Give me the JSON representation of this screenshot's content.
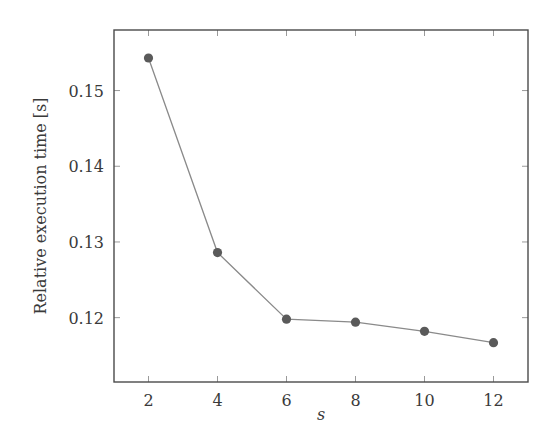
{
  "chart_data": {
    "type": "line",
    "title": "",
    "xlabel": "s",
    "ylabel": "Relative execution time [s]",
    "x": [
      2,
      4,
      6,
      8,
      10,
      12
    ],
    "series": [
      {
        "name": "Relative execution time",
        "values": [
          0.1543,
          0.1286,
          0.1198,
          0.1194,
          0.1182,
          0.1167
        ],
        "color": "#5a5a5a",
        "marker": "circle"
      }
    ],
    "xticks": [
      2,
      4,
      6,
      8,
      10,
      12
    ],
    "xtick_labels": [
      "2",
      "4",
      "6",
      "8",
      "10",
      "12"
    ],
    "yticks": [
      0.12,
      0.13,
      0.14,
      0.15
    ],
    "ytick_labels": [
      "0.12",
      "0.13",
      "0.14",
      "0.15"
    ],
    "xlim": [
      1.0,
      13.0
    ],
    "ylim": [
      0.1115,
      0.158
    ],
    "grid": false,
    "legend": null
  },
  "labels": {
    "xlabel": "s",
    "ylabel": "Relative execution time [s]"
  },
  "colors": {
    "axis": "#4a4a4a",
    "line": "#8a8a8a",
    "marker": "#5a5a5a"
  }
}
